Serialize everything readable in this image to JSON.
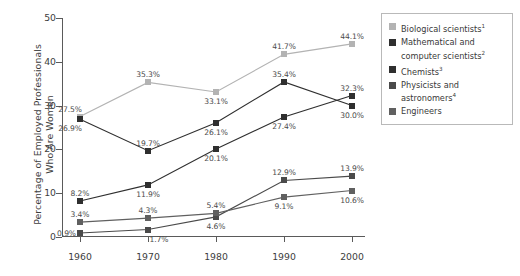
{
  "chart_data": {
    "type": "line",
    "title": "",
    "xlabel": "",
    "ylabel": "Percentage of Employed Professionals Who Are Women",
    "ylabel_lines": [
      "Percentage of Employed Professionals",
      "Who Are Women"
    ],
    "categories": [
      "1960",
      "1970",
      "1980",
      "1990",
      "2000"
    ],
    "x": [
      1960,
      1970,
      1980,
      1990,
      2000
    ],
    "ylim": [
      0,
      50
    ],
    "yticks": [
      0,
      10,
      20,
      30,
      40,
      50
    ],
    "ytick_labels": [
      "0",
      "10",
      "20",
      "30",
      "40",
      "50"
    ],
    "grid": false,
    "legend_position": "right",
    "value_suffix": "%",
    "series": [
      {
        "name": "Biological scientists",
        "footnote": "1",
        "color": "#b3b3b3",
        "values": [
          27.5,
          35.3,
          33.1,
          41.7,
          44.1
        ],
        "labels": [
          "27.5%",
          "35.3%",
          "33.1%",
          "41.7%",
          "44.1%"
        ],
        "label_pos": [
          "above-left",
          "above",
          "below",
          "above",
          "above"
        ]
      },
      {
        "name": "Mathematical and computer scientists",
        "footnote": "2",
        "color": "#2f2f2f",
        "values": [
          26.9,
          19.7,
          26.1,
          35.4,
          30.0
        ],
        "labels": [
          "26.9%",
          "19.7%",
          "26.1%",
          "35.4%",
          "30.0%"
        ],
        "label_pos": [
          "below-left",
          "above",
          "below",
          "above",
          "below"
        ]
      },
      {
        "name": "Chemists",
        "footnote": "3",
        "color": "#2f2f2f",
        "values": [
          8.2,
          11.9,
          20.1,
          27.4,
          32.3
        ],
        "labels": [
          "8.2%",
          "11.9%",
          "20.1%",
          "27.4%",
          "32.3%"
        ],
        "label_pos": [
          "above",
          "below",
          "below",
          "below",
          "above"
        ]
      },
      {
        "name": "Physicists and astronomers",
        "footnote": "4",
        "color": "#4a4a4a",
        "values": [
          0.9,
          1.7,
          4.6,
          12.9,
          13.9
        ],
        "labels": [
          "0.9%",
          "1.7%",
          "4.6%",
          "12.9%",
          "13.9%"
        ],
        "label_pos": [
          "left",
          "below-right",
          "below",
          "above",
          "above"
        ]
      },
      {
        "name": "Engineers",
        "footnote": "",
        "color": "#606060",
        "values": [
          3.4,
          4.3,
          5.4,
          9.1,
          10.6
        ],
        "labels": [
          "3.4%",
          "4.3%",
          "5.4%",
          "9.1%",
          "10.6%"
        ],
        "label_pos": [
          "above",
          "above",
          "above",
          "below",
          "below"
        ]
      }
    ]
  },
  "legend": {
    "items": [
      {
        "label": "Biological scientists",
        "footnote": "1",
        "color": "#b3b3b3"
      },
      {
        "label": "Mathematical and computer scientists",
        "footnote": "2",
        "color": "#2f2f2f"
      },
      {
        "label": "Chemists",
        "footnote": "3",
        "color": "#2f2f2f"
      },
      {
        "label": "Physicists and astronomers",
        "footnote": "4",
        "color": "#4a4a4a"
      },
      {
        "label": "Engineers",
        "footnote": "",
        "color": "#606060"
      }
    ]
  }
}
